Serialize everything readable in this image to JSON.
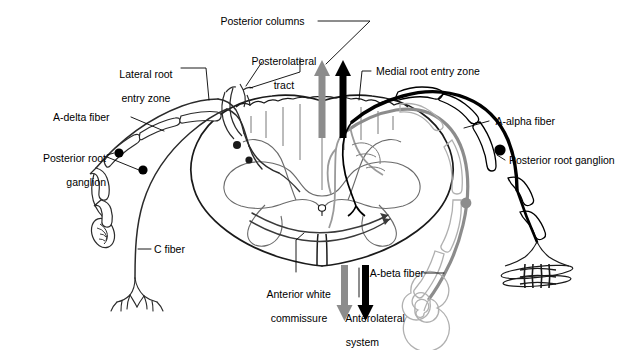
{
  "figure": {
    "colors": {
      "black": "#000000",
      "gray": "#8c8c8c",
      "light_gray": "#b3b3b3",
      "outline": "#3a3a3a",
      "background": "#ffffff"
    }
  },
  "labels": {
    "posterior_columns": "Posterior columns",
    "posterolateral_tract_line1": "Posterolateral",
    "posterolateral_tract_line2": "tract",
    "lateral_root_entry_line1": "Lateral root",
    "lateral_root_entry_line2": "entry zone",
    "medial_root_entry_zone": "Medial root entry zone",
    "a_delta_fiber": "A-delta fiber",
    "a_alpha_fiber": "A-alpha fiber",
    "a_beta_fiber": "A-beta fiber",
    "c_fiber": "C fiber",
    "posterior_root_ganglion_left_line1": "Posterior root",
    "posterior_root_ganglion_left_line2": "ganglion",
    "posterior_root_ganglion_right": "Posterior root ganglion",
    "anterior_white_commissure_line1": "Anterior white",
    "anterior_white_commissure_line2": "commissure",
    "anterolateral_system_line1": "Anterolateral",
    "anterolateral_system_line2": "system"
  },
  "arrows": {
    "posterior_columns_gray": "up-arrow-gray",
    "posterior_columns_black": "up-arrow-black",
    "anterolateral_gray": "down-arrow-gray",
    "anterolateral_black": "down-arrow-black"
  },
  "structures": {
    "cord": "spinal-cord-cross-section",
    "gray_matter": "butterfly-gray-matter",
    "central_canal": "central-canal",
    "muscle_spindle": "muscle-spindle-receptor",
    "pacinian_corpuscle": "pacinian-corpuscle-receptor",
    "encapsulated_ending": "encapsulated-nerve-ending",
    "free_nerve_endings": "free-nerve-endings"
  }
}
